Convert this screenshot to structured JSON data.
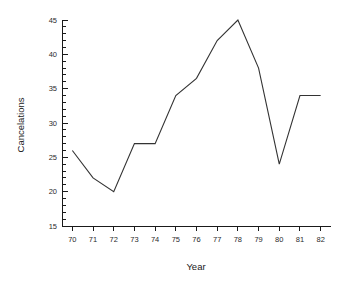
{
  "chart_data": {
    "type": "line",
    "title": "",
    "xlabel": "Year",
    "ylabel": "Cancelations",
    "categories": [
      "70",
      "71",
      "72",
      "73",
      "74",
      "75",
      "76",
      "77",
      "78",
      "79",
      "80",
      "81",
      "82"
    ],
    "x": [
      70,
      71,
      72,
      73,
      74,
      75,
      76,
      77,
      78,
      79,
      80,
      81,
      82
    ],
    "values": [
      26,
      22,
      20,
      27,
      27,
      34,
      36.5,
      42,
      45,
      38,
      24,
      34,
      34
    ],
    "series": [
      {
        "name": "Cancelations",
        "values": [
          26,
          22,
          20,
          27,
          27,
          34,
          36.5,
          42,
          45,
          38,
          24,
          34,
          34
        ],
        "color": "#333333"
      }
    ],
    "xlim": [
      69.5,
      82.5
    ],
    "ylim": [
      15,
      45
    ],
    "yticks": [
      15,
      20,
      25,
      30,
      35,
      40,
      45
    ],
    "ytick_labels": [
      "15",
      "20",
      "25",
      "30",
      "35",
      "40",
      "45"
    ],
    "y_minor_interval": 1,
    "xticks": [
      70,
      71,
      72,
      73,
      74,
      75,
      76,
      77,
      78,
      79,
      80,
      81,
      82
    ],
    "xtick_labels": [
      "70",
      "71",
      "72",
      "73",
      "74",
      "75",
      "76",
      "77",
      "78",
      "79",
      "80",
      "81",
      "82"
    ],
    "grid": false,
    "legend": false,
    "legend_position": "none",
    "line_color": "#333333",
    "axis_color": "#1a1a1a",
    "background_color": "#ffffff"
  }
}
